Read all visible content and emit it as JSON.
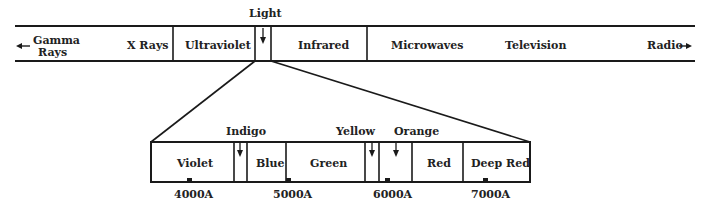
{
  "top_band": {
    "regions": [
      {
        "label": "Gamma",
        "label2": "Rays"
      },
      {
        "label": "X Rays"
      },
      {
        "label": "Ultraviolet"
      },
      {
        "label": "Light"
      },
      {
        "label": "Infrared"
      },
      {
        "label": "Microwaves"
      },
      {
        "label": "Television"
      },
      {
        "label": "Radio"
      }
    ]
  },
  "visible_band": {
    "bands": [
      {
        "label": "Violet"
      },
      {
        "label": "Indigo"
      },
      {
        "label": "Blue"
      },
      {
        "label": "Green"
      },
      {
        "label": "Yellow"
      },
      {
        "label": "Orange"
      },
      {
        "label": "Red"
      },
      {
        "label": "Deep Red"
      }
    ],
    "ticks": [
      {
        "label": "4000A"
      },
      {
        "label": "5000A"
      },
      {
        "label": "6000A"
      },
      {
        "label": "7000A"
      }
    ]
  }
}
